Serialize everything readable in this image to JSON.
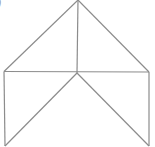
{
  "diagram": {
    "partial_label": ")",
    "stroke_color": "#8c8c8c",
    "stroke_width": 1.2,
    "vertices": {
      "apex": [
        78,
        0
      ],
      "left": [
        4,
        71.5
      ],
      "right": [
        149,
        72
      ],
      "center": [
        77,
        73
      ],
      "bottom_left": [
        5,
        146
      ],
      "bottom_right": [
        149,
        146
      ]
    },
    "segments": [
      [
        "apex",
        "left"
      ],
      [
        "apex",
        "right"
      ],
      [
        "apex",
        "center"
      ],
      [
        "left",
        "right"
      ],
      [
        "left",
        "bottom_left"
      ],
      [
        "right",
        "bottom_right"
      ],
      [
        "center",
        "bottom_left"
      ],
      [
        "center",
        "bottom_right"
      ]
    ]
  }
}
